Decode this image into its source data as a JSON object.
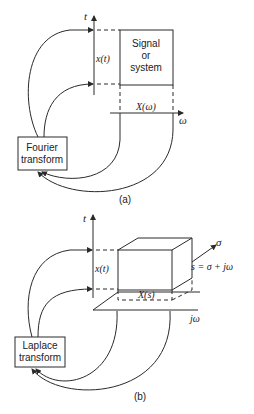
{
  "panel_a": {
    "caption": "(a)",
    "time_axis_label": "t",
    "freq_axis_label": "ω",
    "time_signal_label": "x(t)",
    "freq_signal_label": "X(ω)",
    "box_label_line1": "Signal",
    "box_label_line2": "or",
    "box_label_line3": "system",
    "transform_line1": "Fourier",
    "transform_line2": "transform"
  },
  "panel_b": {
    "caption": "(b)",
    "time_axis_label": "t",
    "sigma_axis_label": "σ",
    "jw_axis_label": "jω",
    "time_signal_label": "x(t)",
    "s_signal_label": "X(s)",
    "s_definition": "s = σ + jω",
    "transform_line1": "Laplace",
    "transform_line2": "transform"
  },
  "colors": {
    "ink": "#2a2a2a",
    "background": "#ffffff"
  }
}
